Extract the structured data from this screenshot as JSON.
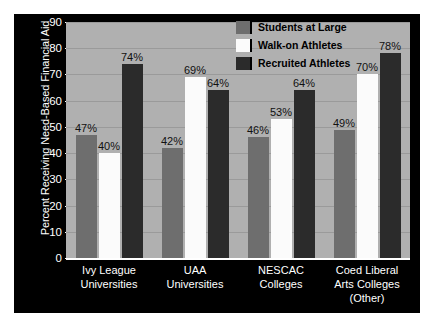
{
  "chart_data": {
    "type": "bar",
    "title": "",
    "xlabel": "",
    "ylabel": "Percent Receiving Need-Based Financial Aid",
    "ylim": [
      0,
      90
    ],
    "ytick_labels": [
      "90",
      "80",
      "70",
      "60",
      "50",
      "40",
      "30",
      "20",
      "10",
      "0"
    ],
    "ytick_values": [
      90,
      80,
      70,
      60,
      50,
      40,
      30,
      20,
      10,
      0
    ],
    "grid": true,
    "legend_position": "top-right",
    "categories": [
      "Ivy League Universities",
      "UAA Universities",
      "NESCAC Colleges",
      "Coed Liberal Arts Colleges (Other)"
    ],
    "category_lines": [
      [
        "Ivy League",
        "Universities"
      ],
      [
        "UAA",
        "Universities"
      ],
      [
        "NESCAC",
        "Colleges"
      ],
      [
        "Coed Liberal",
        "Arts Colleges",
        "(Other)"
      ]
    ],
    "series": [
      {
        "name": "Students at Large",
        "color": "#6e6e6e",
        "values": [
          47,
          42,
          46,
          49
        ],
        "labels": [
          "47%",
          "42%",
          "46%",
          "49%"
        ]
      },
      {
        "name": "Walk-on Athletes",
        "color": "#fbfbfb",
        "values": [
          40,
          69,
          53,
          70
        ],
        "labels": [
          "40%",
          "69%",
          "53%",
          "70%"
        ]
      },
      {
        "name": "Recruited Athletes",
        "color": "#2b2b2b",
        "values": [
          74,
          64,
          64,
          78
        ],
        "labels": [
          "74%",
          "64%",
          "64%",
          "78%"
        ]
      }
    ]
  },
  "legend": {
    "items": [
      {
        "label": "Students at Large",
        "color": "#6e6e6e"
      },
      {
        "label": "Walk-on Athletes",
        "color": "#fbfbfb"
      },
      {
        "label": "Recruited Athletes",
        "color": "#2b2b2b"
      }
    ]
  },
  "colors": {
    "panel_background": "#000000",
    "plot_background": "#b0b0b0",
    "gridline": "#9a9a9a",
    "axis": "#ffffff",
    "axis_text": "#ffffff",
    "value_text": "#111111"
  }
}
